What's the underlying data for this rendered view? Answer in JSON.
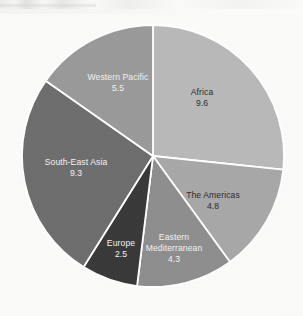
{
  "figure": {
    "background_color": "#fbfbfa",
    "separator_color": "#ffffff",
    "center_x": 153,
    "center_y": 156,
    "radius": 131
  },
  "chart_data": {
    "type": "pie",
    "title": "",
    "subtitle": "",
    "xlabel": "",
    "ylabel": "",
    "legend_position": "none",
    "grid": false,
    "start_angle_deg": 0,
    "direction": "clockwise",
    "total": 36.0,
    "value_suffix": "",
    "categories": [
      "Africa",
      "The Americas",
      "Eastern Mediterranean",
      "Europe",
      "South-East Asia",
      "Western Pacific"
    ],
    "values": [
      9.6,
      4.8,
      4.3,
      2.5,
      9.3,
      5.5
    ],
    "slices": [
      {
        "name": "africa",
        "label": "Africa",
        "value_label": "9.6",
        "value": 9.6,
        "angle_deg": 96.0,
        "percent": "26.7",
        "color": "#b9b9b9",
        "text_color": "dark",
        "label_lines": [
          "Africa"
        ],
        "label_x": 202,
        "label_y": 95
      },
      {
        "name": "the-americas",
        "label": "The Americas",
        "value_label": "4.8",
        "value": 4.8,
        "angle_deg": 48.0,
        "percent": "13.3",
        "color": "#a8a8a8",
        "text_color": "dark",
        "label_lines": [
          "The Americas"
        ],
        "label_x": 213,
        "label_y": 198
      },
      {
        "name": "eastern-mediterranean",
        "label": "Eastern Mediterranean",
        "value_label": "4.3",
        "value": 4.3,
        "angle_deg": 43.0,
        "percent": "11.9",
        "color": "#8e8e8e",
        "text_color": "light",
        "label_lines": [
          "Eastern",
          "Mediterranean"
        ],
        "label_x": 174,
        "label_y": 240
      },
      {
        "name": "europe",
        "label": "Europe",
        "value_label": "2.5",
        "value": 2.5,
        "angle_deg": 25.0,
        "percent": "6.9",
        "color": "#3a3a3a",
        "text_color": "light",
        "label_lines": [
          "Europe"
        ],
        "label_x": 121,
        "label_y": 246
      },
      {
        "name": "south-east-asia",
        "label": "South-East Asia",
        "value_label": "9.3",
        "value": 9.3,
        "angle_deg": 93.0,
        "percent": "25.8",
        "color": "#6e6e6e",
        "text_color": "light",
        "label_lines": [
          "South-East Asia"
        ],
        "label_x": 76,
        "label_y": 165
      },
      {
        "name": "western-pacific",
        "label": "Western Pacific",
        "value_label": "5.5",
        "value": 5.5,
        "angle_deg": 55.0,
        "percent": "15.3",
        "color": "#9a9a9a",
        "text_color": "light",
        "label_lines": [
          "Western Pacific"
        ],
        "label_x": 118,
        "label_y": 80
      }
    ]
  }
}
